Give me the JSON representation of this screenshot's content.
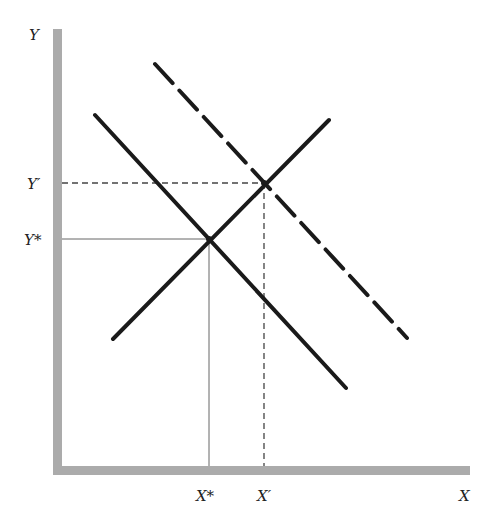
{
  "diagram": {
    "type": "supply-demand-shift",
    "axes": {
      "y_label": "Y",
      "x_label": "X",
      "color": "#a8a8a8"
    },
    "tick_labels": {
      "y_prime": "Y′",
      "y_star": "Y*",
      "x_star": "X*",
      "x_prime": "X′"
    },
    "curves": [
      {
        "name": "original-downward-line",
        "style": "solid"
      },
      {
        "name": "upward-line",
        "style": "solid"
      },
      {
        "name": "shifted-downward-line",
        "style": "dashed"
      }
    ],
    "equilibria": [
      {
        "name": "original",
        "x_label": "X*",
        "y_label": "Y*",
        "guide_style": "thin-solid"
      },
      {
        "name": "new",
        "x_label": "X′",
        "y_label": "Y′",
        "guide_style": "dashed"
      }
    ],
    "line_color": "#1a1a1a"
  }
}
